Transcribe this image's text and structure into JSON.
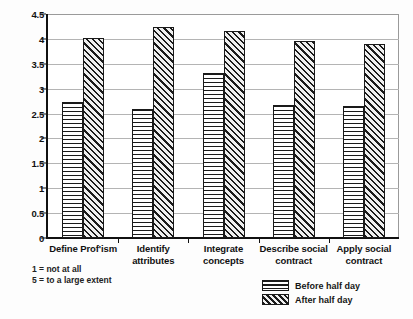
{
  "chart_data": {
    "type": "bar",
    "title": "",
    "xlabel": "",
    "ylabel": "",
    "ylim": [
      0,
      4.5
    ],
    "grid": true,
    "legend_position": "bottom-right",
    "categories": [
      "Define Prof'ism",
      "Identify attributes",
      "Integrate concepts",
      "Describe social contract",
      "Apply social contract"
    ],
    "category_lines": [
      [
        "Define Prof'ism"
      ],
      [
        "Identify attributes"
      ],
      [
        "Integrate",
        "concepts"
      ],
      [
        "Describe social",
        "contract"
      ],
      [
        "Apply social",
        "contract"
      ]
    ],
    "series": [
      {
        "name": "Before half day",
        "pattern": "horizontal-lines",
        "values": [
          2.73,
          2.6,
          3.31,
          2.67,
          2.65
        ]
      },
      {
        "name": "After half day",
        "pattern": "diagonal-hatch",
        "values": [
          4.02,
          4.23,
          4.16,
          3.96,
          3.9
        ]
      }
    ],
    "yticks": [
      "0",
      "0.5",
      "1",
      "1.5",
      "2",
      "2.5",
      "3",
      "3.5",
      "4",
      "4.5"
    ],
    "ytick_values": [
      0,
      0.5,
      1,
      1.5,
      2,
      2.5,
      3,
      3.5,
      4,
      4.5
    ],
    "annotations": [
      "1 = not at all",
      "5 = to a large extent"
    ]
  },
  "legend": {
    "items": [
      {
        "label": "Before half day"
      },
      {
        "label": "After half day"
      }
    ]
  },
  "colors": {
    "axis": "#111111",
    "grid": "#b4b4b4",
    "bar_outline": "#1a1a1a",
    "background": "#fdfdfd",
    "plot_background": "#ffffff"
  }
}
